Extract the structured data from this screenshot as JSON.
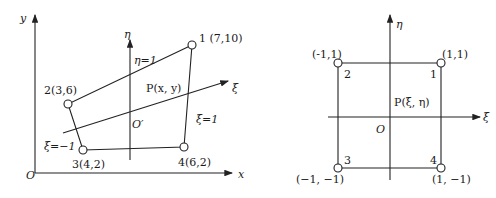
{
  "left_diagram": {
    "title": "physical element (x, y)",
    "axes": {
      "x_label": "x",
      "y_label": "y",
      "origin_label": "O"
    },
    "local_axes": {
      "eta_label": "η",
      "xi_label": "ξ",
      "local_origin_label": "O′"
    },
    "nodes": [
      {
        "id": "1",
        "label": "1 (7,10)"
      },
      {
        "id": "2",
        "label": "2(3,6)"
      },
      {
        "id": "3",
        "label": "3(4,2)"
      },
      {
        "id": "4",
        "label": "4(6,2)"
      }
    ],
    "edge_labels": {
      "eta_pos": "η=1",
      "xi_pos": "ξ=1",
      "xi_neg": "ξ=−1"
    },
    "point_label": "P(x, y)"
  },
  "right_diagram": {
    "title": "reference element (ξ, η)",
    "axes": {
      "xi_label": "ξ",
      "eta_label": "η",
      "origin_label": "O"
    },
    "nodes": [
      {
        "id": "1",
        "number": "1",
        "coord": "(1,1)"
      },
      {
        "id": "2",
        "number": "2",
        "coord": "(-1,1)"
      },
      {
        "id": "3",
        "number": "3",
        "coord": "(−1, −1)"
      },
      {
        "id": "4",
        "number": "4",
        "coord": "(1, −1)"
      }
    ],
    "point_label": "P(ξ, η)"
  }
}
